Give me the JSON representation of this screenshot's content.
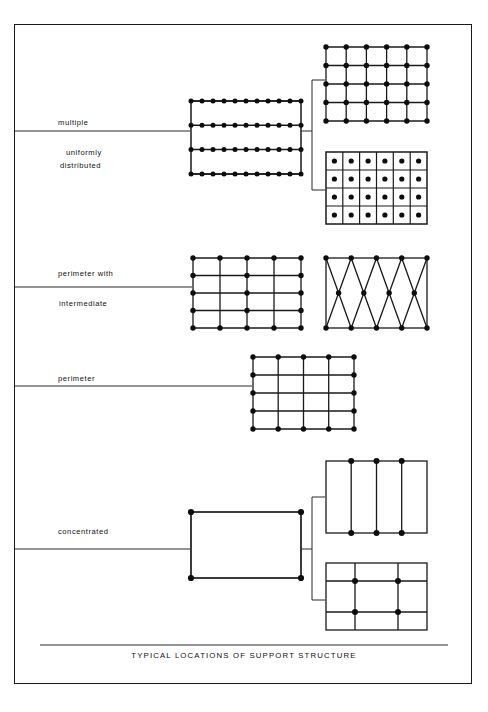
{
  "figure": {
    "caption": "TYPICAL LOCATIONS OF SUPPORT STRUCTURE",
    "frame": {
      "stroke": "#1a1a1a"
    }
  },
  "colors": {
    "line": "#1a1a1a",
    "dot": "#0d0d0d",
    "background": "#ffffff",
    "divider": "#333333"
  },
  "rows": [
    {
      "id": "multiple-uniformly-distributed",
      "label_above": "multiple",
      "label_below_line1": "uniformly",
      "label_below_line2": "distributed",
      "diagrams": [
        {
          "id": "linear-rows",
          "type": "rect-with-horizontal-rows",
          "rows": 4,
          "dots_per_row": 11
        },
        {
          "id": "point-grid",
          "type": "grid-nodes",
          "cols": 6,
          "rows": 5
        },
        {
          "id": "cell-grid",
          "type": "cells-with-center-dots",
          "cols": 6,
          "rows": 4
        }
      ]
    },
    {
      "id": "perimeter-with-intermediate",
      "label_above": "perimeter with",
      "label_below_line1": "intermediate",
      "label_below_line2": "",
      "diagrams": [
        {
          "id": "perimeter-intermediate-grid",
          "type": "grid-perimeter-plus-center-column",
          "cols": 5,
          "rows": 5
        },
        {
          "id": "truss-zigzag",
          "type": "zigzag-truss",
          "top_dots": 5,
          "bottom_dots": 5,
          "middle_dots": 4
        }
      ]
    },
    {
      "id": "perimeter",
      "label_above": "perimeter",
      "label_below_line1": "",
      "label_below_line2": "",
      "diagrams": [
        {
          "id": "perimeter-grid",
          "type": "grid-perimeter-only",
          "cols": 5,
          "rows": 5
        }
      ]
    },
    {
      "id": "concentrated",
      "label_above": "concentrated",
      "label_below_line1": "",
      "label_below_line2": "",
      "diagrams": [
        {
          "id": "corner-rect",
          "type": "rect-corner-dots",
          "dots": 4
        },
        {
          "id": "three-vertical-lines",
          "type": "rect-with-vertical-ribs",
          "ribs": 3,
          "dots": 6
        },
        {
          "id": "cross-grid",
          "type": "rect-with-cross-grid",
          "v_lines": 2,
          "h_lines": 2,
          "dots": 4
        }
      ]
    }
  ]
}
